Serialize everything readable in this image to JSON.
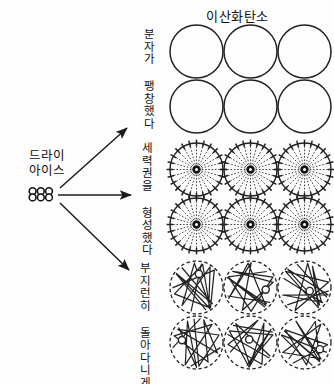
{
  "title": "이산화탄소",
  "source": {
    "label_line1": "드라이",
    "label_line2": "아이스",
    "icon_name": "dry-ice-lattice-icon"
  },
  "branches": [
    {
      "id": "expanded",
      "label": "분자가 팽창했다",
      "arrow_name": "arrow-up-right",
      "group_name": "molecule-group-plain"
    },
    {
      "id": "territory",
      "label": "세력권을 형성했다",
      "arrow_name": "arrow-horizontal",
      "group_name": "molecule-group-spoked"
    },
    {
      "id": "moving",
      "label": "부지런히 돌아다니게 됐다",
      "arrow_name": "arrow-down-right",
      "group_name": "molecule-group-trajectories"
    }
  ],
  "colors": {
    "ink": "#1a1a1a",
    "background": "#fdfdfd",
    "stroke": "#222222"
  },
  "diagram": {
    "columns": 3,
    "rows": 2,
    "circle_count": 6,
    "spokes_per_circle": 24
  }
}
